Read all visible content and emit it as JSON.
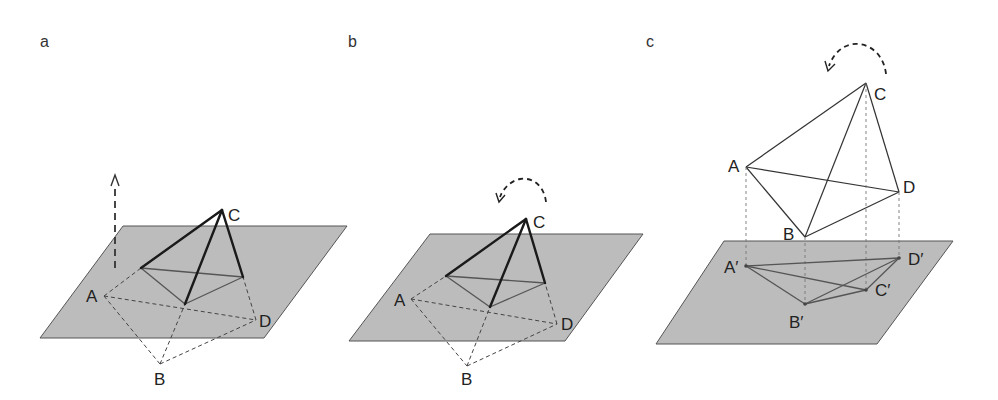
{
  "figure": {
    "panels": [
      {
        "id": "a",
        "label": "a",
        "vertices": {
          "A": "A",
          "B": "B",
          "C": "C",
          "D": "D"
        },
        "annotation": "vertical-translation-arrow"
      },
      {
        "id": "b",
        "label": "b",
        "vertices": {
          "A": "A",
          "B": "B",
          "C": "C",
          "D": "D"
        },
        "annotation": "rotation-arrow"
      },
      {
        "id": "c",
        "label": "c",
        "vertices": {
          "A": "A",
          "B": "B",
          "C": "C",
          "D": "D"
        },
        "projections": {
          "A": "A′",
          "B": "B′",
          "C": "C′",
          "D": "D′"
        },
        "annotation": "rotation-arrow"
      }
    ],
    "colors": {
      "plane_fill": "#bcbcbc",
      "edge": "#1a1a1a",
      "background": "#ffffff"
    }
  }
}
